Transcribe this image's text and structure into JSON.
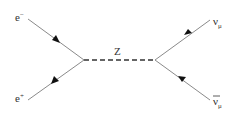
{
  "diagram": {
    "type": "feynman-diagram",
    "process": "e- e+ -> Z -> nu_mu anti-nu_mu",
    "colors": {
      "line": "#8a8a8a",
      "arrow": "#111111",
      "text": "#333333",
      "background": "#ffffff"
    },
    "vertices": [
      {
        "id": "v1",
        "x": 84,
        "y": 60
      },
      {
        "id": "v2",
        "x": 155,
        "y": 60
      }
    ],
    "particles": {
      "electron": {
        "label": "e",
        "superscript": "−"
      },
      "positron": {
        "label": "e",
        "superscript": "+"
      },
      "z_boson": {
        "label": "Z"
      },
      "muon_neutrino": {
        "label": "ν",
        "subscript": "μ"
      },
      "muon_antineutrino": {
        "label": "ν",
        "subscript": "μ",
        "overbar": true
      }
    },
    "propagators": [
      {
        "name": "electron",
        "type": "fermion",
        "from": [
          28,
          19
        ],
        "to": [
          84,
          60
        ],
        "arrow": "toward-vertex"
      },
      {
        "name": "positron",
        "type": "fermion",
        "from": [
          84,
          60
        ],
        "to": [
          28,
          100
        ],
        "arrow": "away-from-vertex"
      },
      {
        "name": "z_boson",
        "type": "boson-dashed",
        "from": [
          84,
          60
        ],
        "to": [
          155,
          60
        ]
      },
      {
        "name": "muon_neutrino",
        "type": "fermion",
        "from": [
          155,
          60
        ],
        "to": [
          210,
          20
        ],
        "arrow": "away-from-vertex"
      },
      {
        "name": "muon_antineutrino",
        "type": "fermion",
        "from": [
          210,
          100
        ],
        "to": [
          155,
          60
        ],
        "arrow": "toward-vertex"
      }
    ]
  }
}
